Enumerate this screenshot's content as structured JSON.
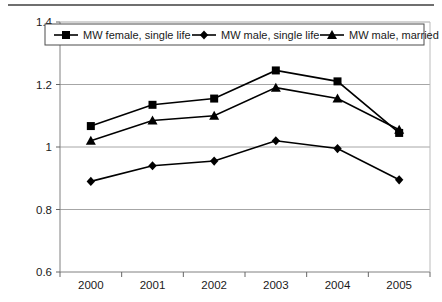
{
  "chart_data": {
    "type": "line",
    "title": "",
    "xlabel": "",
    "ylabel": "",
    "categories": [
      "2000",
      "2001",
      "2002",
      "2003",
      "2004",
      "2005"
    ],
    "x": [
      2000,
      2001,
      2002,
      2003,
      2004,
      2005
    ],
    "ylim": [
      0.6,
      1.4
    ],
    "yticks": [
      "0.6",
      "0.8",
      "1",
      "1.2",
      "1.4"
    ],
    "ytick_values": [
      0.6,
      0.8,
      1.0,
      1.2,
      1.4
    ],
    "grid": true,
    "grid_axis": "y",
    "legend_position": "top-inside",
    "series": [
      {
        "name": "MW female, single life",
        "marker": "square",
        "values": [
          1.067,
          1.135,
          1.155,
          1.245,
          1.21,
          1.045
        ]
      },
      {
        "name": "MW male, single life",
        "marker": "diamond",
        "values": [
          0.89,
          0.94,
          0.955,
          1.02,
          0.995,
          0.895
        ]
      },
      {
        "name": "MW male, married",
        "marker": "triangle",
        "values": [
          1.02,
          1.085,
          1.1,
          1.19,
          1.155,
          1.055
        ]
      }
    ],
    "colors": {
      "line": "#000000",
      "grid": "#a6a6a6",
      "axis": "#808080",
      "plot_background": "#ffffff",
      "text": "#1a1a1a"
    }
  },
  "legend": {
    "items": [
      {
        "label": "MW female, single life",
        "marker": "square-marker-icon"
      },
      {
        "label": "MW male, single life",
        "marker": "diamond-marker-icon"
      },
      {
        "label": "MW male, married",
        "marker": "triangle-marker-icon"
      }
    ]
  },
  "axes": {
    "y_labels": [
      "1.4",
      "1.2",
      "1",
      "0.8",
      "0.6"
    ],
    "x_labels": [
      "2000",
      "2001",
      "2002",
      "2003",
      "2004",
      "2005"
    ]
  }
}
